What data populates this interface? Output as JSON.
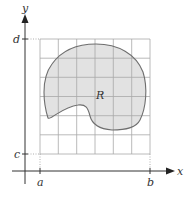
{
  "diagram": {
    "type": "region-on-grid",
    "axes": {
      "x_label": "x",
      "y_label": "y"
    },
    "ticks": {
      "x": [
        {
          "label": "a",
          "x": 40
        },
        {
          "label": "b",
          "x": 150
        }
      ],
      "y": [
        {
          "label": "d",
          "y": 39
        },
        {
          "label": "c",
          "y": 154
        }
      ]
    },
    "region": {
      "label": "R"
    },
    "grid": {
      "columns": 6,
      "rows": 6
    },
    "colors": {
      "region_fill": "#e2e2e2",
      "region_stroke": "#6e6e6e",
      "grid_line": "#a8a8a8",
      "axis": "#333333",
      "dotted": "#9a9a9a"
    }
  }
}
